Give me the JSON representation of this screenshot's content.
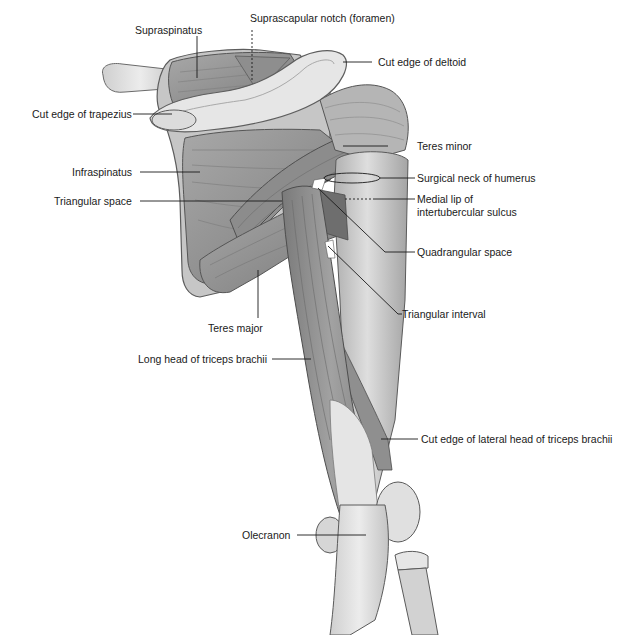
{
  "figure": {
    "colors": {
      "background": "#ffffff",
      "muscle": "#9b9b9b",
      "muscle_dark": "#6f6f6f",
      "muscle_light": "#bdbdbd",
      "bone": "#d9d9d9",
      "bone_light": "#ececec",
      "tendon": "#e4e4e4",
      "leader_line": "#1a1a1a",
      "label_text": "#1a1a1a"
    }
  },
  "labels": {
    "supraspinatus": "Supraspinatus",
    "suprascapular_notch": "Suprascapular notch (foramen)",
    "cut_edge_deltoid": "Cut edge of deltoid",
    "cut_edge_trapezius": "Cut edge of trapezius",
    "infraspinatus": "Infraspinatus",
    "triangular_space": "Triangular space",
    "teres_minor": "Teres minor",
    "surgical_neck": "Surgical neck of humerus",
    "medial_lip_line1": "Medial lip of",
    "medial_lip_line2": "intertubercular sulcus",
    "quadrangular_space": "Quadrangular space",
    "triangular_interval": "Triangular interval",
    "teres_major": "Teres major",
    "long_head_triceps": "Long head of triceps brachii",
    "cut_edge_lateral_head": "Cut edge of lateral head of triceps brachii",
    "olecranon": "Olecranon"
  }
}
